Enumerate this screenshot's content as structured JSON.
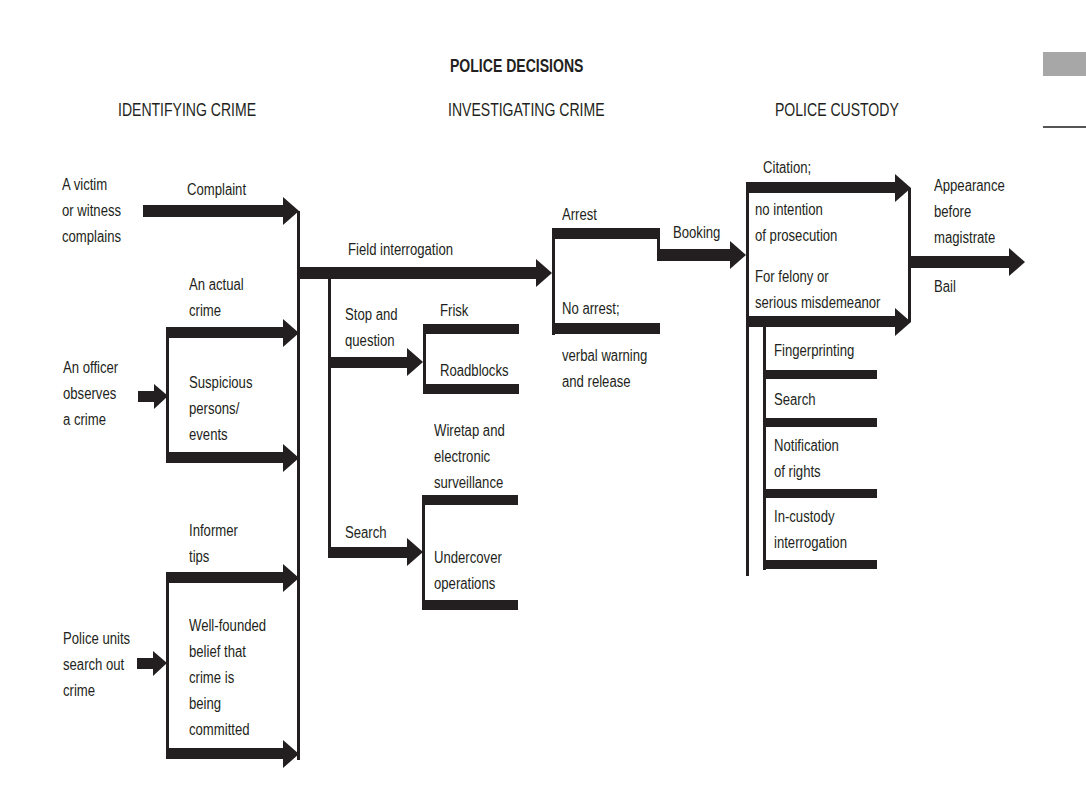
{
  "diagram": {
    "title": "POLICE DECISIONS",
    "sections": [
      {
        "label": "IDENTIFYING CRIME",
        "x": 118,
        "y": 100
      },
      {
        "label": "INVESTIGATING CRIME",
        "x": 448,
        "y": 100
      },
      {
        "label": "POLICE CUSTODY",
        "x": 775,
        "y": 100
      }
    ],
    "colors": {
      "ink": "#231f20",
      "background": "#ffffff",
      "margin_tab": "#a7a7a7"
    },
    "labels": [
      {
        "id": "victim-complains",
        "text": "A victim\nor witness\ncomplains",
        "x": 62,
        "y": 172
      },
      {
        "id": "complaint",
        "text": "Complaint",
        "x": 187,
        "y": 177
      },
      {
        "id": "officer-observes",
        "text": "An officer\nobserves\na crime",
        "x": 63,
        "y": 355
      },
      {
        "id": "actual-crime",
        "text": "An actual\ncrime",
        "x": 189,
        "y": 272
      },
      {
        "id": "suspicious-persons",
        "text": "Suspicious\npersons/\nevents",
        "x": 189,
        "y": 370
      },
      {
        "id": "police-units",
        "text": "Police units\nsearch out\ncrime",
        "x": 63,
        "y": 626
      },
      {
        "id": "informer-tips",
        "text": "Informer\ntips",
        "x": 189,
        "y": 518
      },
      {
        "id": "well-founded-belief",
        "text": "Well-founded\nbelief that\ncrime is\nbeing\ncommitted",
        "x": 189,
        "y": 613
      },
      {
        "id": "field-interrogation",
        "text": "Field interrogation",
        "x": 348,
        "y": 237
      },
      {
        "id": "stop-and-question",
        "text": "Stop and\nquestion",
        "x": 345,
        "y": 302
      },
      {
        "id": "frisk",
        "text": "Frisk",
        "x": 440,
        "y": 298
      },
      {
        "id": "roadblocks",
        "text": "Roadblocks",
        "x": 440,
        "y": 358
      },
      {
        "id": "wiretap",
        "text": "Wiretap and\nelectronic\nsurveillance",
        "x": 434,
        "y": 418
      },
      {
        "id": "search-investigate",
        "text": "Search",
        "x": 345,
        "y": 520
      },
      {
        "id": "undercover",
        "text": "Undercover\noperations",
        "x": 434,
        "y": 545
      },
      {
        "id": "arrest",
        "text": "Arrest",
        "x": 562,
        "y": 202
      },
      {
        "id": "no-arrest",
        "text": "No arrest;",
        "x": 562,
        "y": 296
      },
      {
        "id": "verbal-warning",
        "text": "verbal warning\nand release",
        "x": 562,
        "y": 343
      },
      {
        "id": "booking",
        "text": "Booking",
        "x": 673,
        "y": 220
      },
      {
        "id": "citation",
        "text": "Citation;",
        "x": 763,
        "y": 155
      },
      {
        "id": "no-intention",
        "text": "no intention\nof prosecution",
        "x": 755,
        "y": 197
      },
      {
        "id": "felony",
        "text": "For felony or\nserious misdemeanor",
        "x": 755,
        "y": 264
      },
      {
        "id": "fingerprinting",
        "text": "Fingerprinting",
        "x": 774,
        "y": 338
      },
      {
        "id": "search-custody",
        "text": "Search",
        "x": 774,
        "y": 387
      },
      {
        "id": "notification-rights",
        "text": "Notification\nof rights",
        "x": 774,
        "y": 433
      },
      {
        "id": "in-custody-interrogation",
        "text": "In-custody\ninterrogation",
        "x": 774,
        "y": 504
      },
      {
        "id": "appearance-magistrate",
        "text": "Appearance\nbefore\nmagistrate",
        "x": 934,
        "y": 173
      },
      {
        "id": "bail",
        "text": "Bail",
        "x": 934,
        "y": 274
      }
    ]
  },
  "chart_data": {
    "type": "flowchart",
    "title": "POLICE DECISIONS",
    "stages": [
      "IDENTIFYING CRIME",
      "INVESTIGATING CRIME",
      "POLICE CUSTODY"
    ],
    "nodes": [
      "A victim or witness complains",
      "Complaint",
      "An officer observes a crime",
      "An actual crime",
      "Suspicious persons/events",
      "Police units search out crime",
      "Informer tips",
      "Well-founded belief that crime is being committed",
      "Field interrogation",
      "Stop and question",
      "Frisk",
      "Roadblocks",
      "Search",
      "Wiretap and electronic surveillance",
      "Undercover operations",
      "Arrest",
      "No arrest; verbal warning and release",
      "Booking",
      "Citation; no intention of prosecution",
      "For felony or serious misdemeanor",
      "Fingerprinting",
      "Search",
      "Notification of rights",
      "In-custody interrogation",
      "Appearance before magistrate",
      "Bail"
    ],
    "edges": [
      [
        "A victim or witness complains",
        "Complaint"
      ],
      [
        "An officer observes a crime",
        "An actual crime"
      ],
      [
        "An officer observes a crime",
        "Suspicious persons/events"
      ],
      [
        "Police units search out crime",
        "Informer tips"
      ],
      [
        "Police units search out crime",
        "Well-founded belief that crime is being committed"
      ],
      [
        "IDENTIFYING CRIME",
        "Field interrogation"
      ],
      [
        "Field interrogation",
        "Stop and question"
      ],
      [
        "Field interrogation",
        "Search"
      ],
      [
        "Stop and question",
        "Frisk"
      ],
      [
        "Stop and question",
        "Roadblocks"
      ],
      [
        "Search",
        "Wiretap and electronic surveillance"
      ],
      [
        "Search",
        "Undercover operations"
      ],
      [
        "Field interrogation",
        "Arrest"
      ],
      [
        "Field interrogation",
        "No arrest; verbal warning and release"
      ],
      [
        "Arrest",
        "Booking"
      ],
      [
        "Booking",
        "Citation; no intention of prosecution"
      ],
      [
        "Booking",
        "For felony or serious misdemeanor"
      ],
      [
        "Booking",
        "Fingerprinting"
      ],
      [
        "Booking",
        "Search"
      ],
      [
        "Booking",
        "Notification of rights"
      ],
      [
        "Booking",
        "In-custody interrogation"
      ],
      [
        "POLICE CUSTODY",
        "Appearance before magistrate"
      ],
      [
        "POLICE CUSTODY",
        "Bail"
      ]
    ]
  }
}
